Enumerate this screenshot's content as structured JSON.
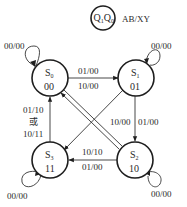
{
  "legend": {
    "node_label": "Q",
    "node_sub1": "1",
    "node_label2": "Q",
    "node_sub2": "0",
    "edge_format": "AB/XY"
  },
  "states": [
    {
      "id": "S0",
      "name": "S",
      "sub": "0",
      "code": "00",
      "self_loop": "00/00"
    },
    {
      "id": "S1",
      "name": "S",
      "sub": "1",
      "code": "01",
      "self_loop": "00/00"
    },
    {
      "id": "S2",
      "name": "S",
      "sub": "2",
      "code": "10",
      "self_loop": "00/00"
    },
    {
      "id": "S3",
      "name": "S",
      "sub": "3",
      "code": "11",
      "self_loop": "00/00"
    }
  ],
  "transitions": [
    {
      "from": "S0",
      "to": "S1",
      "labels": [
        "01/00",
        "10/00"
      ]
    },
    {
      "from": "S1",
      "to": "S2",
      "labels": [
        "01/00"
      ]
    },
    {
      "from": "S1",
      "to": "S3",
      "labels": [
        "10/00"
      ]
    },
    {
      "from": "S2",
      "to": "S3",
      "labels": [
        "10/10",
        "01/00"
      ]
    },
    {
      "from": "S2",
      "to": "S0",
      "labels": []
    },
    {
      "from": "S3",
      "to": "S0",
      "labels": [
        "01/10",
        "或",
        "10/11"
      ]
    }
  ],
  "colors": {
    "stroke": "#1e1e1e",
    "text": "#2a2a2a",
    "background": "#ffffff"
  }
}
